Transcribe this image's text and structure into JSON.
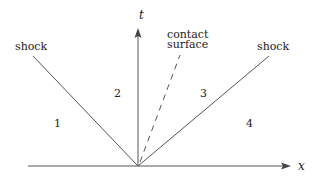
{
  "diagram": {
    "axes": {
      "x_label": "x",
      "t_label": "t"
    },
    "lines": {
      "left_shock_label": "shock",
      "right_shock_label": "shock",
      "contact_label_line1": "contact",
      "contact_label_line2": "surface"
    },
    "regions": [
      "1",
      "2",
      "3",
      "4"
    ],
    "colors": {
      "line": "#555555",
      "text": "#222222"
    }
  }
}
